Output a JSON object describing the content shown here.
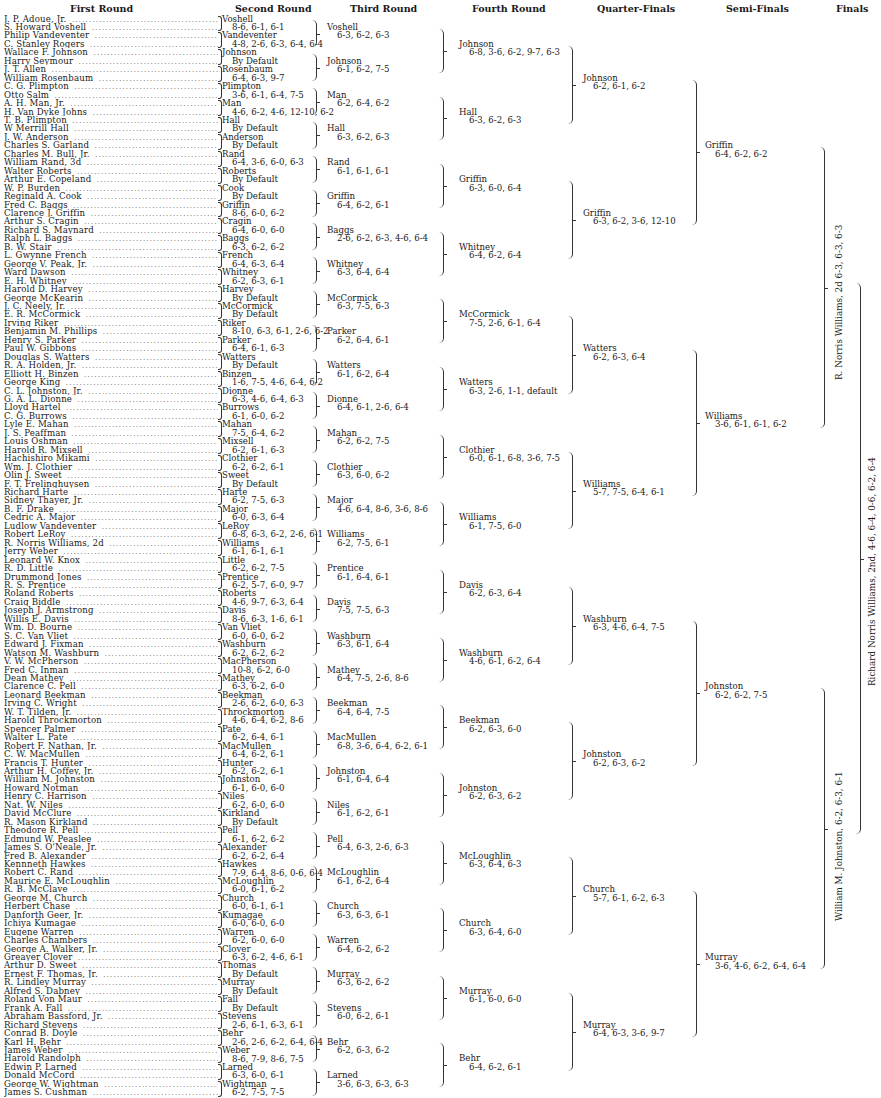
{
  "headers": {
    "first_round": "First Round",
    "second_round": "Second Round",
    "third_round": "Third Round",
    "fourth_round": "Fourth Round",
    "quarter_finals": "Quarter-Finals",
    "semi_finals": "Semi-Finals",
    "finals": "Finals"
  },
  "first_round": [
    "J. P. Adoue, Jr.",
    "S. Howard Voshell",
    "Philip Vandeventer",
    "C. Stanley Rogers",
    "Wallace F. Johnson",
    "Harry Seymour",
    "J. T. Allen",
    "William Rosenbaum",
    "C. G. Plimpton",
    "Otto Salm",
    "A. H. Man, Jr.",
    "H. Van Dyke Johns",
    "T. B. Plimpton",
    "W Merrill Hall",
    "J. W. Anderson",
    "Charles S. Garland",
    "Charles M. Bull, Jr.",
    "William Rand, 3d",
    "Walter Roberts",
    "Arthur E. Copeland",
    "W. P. Burden",
    "Reginald A. Cook",
    "Fred C. Baggs",
    "Clarence J. Griffin",
    "Arthur S. Cragin",
    "Richard S. Maynard",
    "Ralph L. Baggs",
    "B. W. Stair",
    "L. Gwynne French",
    "George V. Peak, Jr.",
    "Ward Dawson",
    "E. H. Whitney",
    "Harold D. Harvey",
    "George McKearin",
    "J. C. Neely, Jr.",
    "E. R. McCormick",
    "Irving Riker",
    "Benjamin M. Phillips",
    "Henry S. Parker",
    "Paul W. Gibbons",
    "Douglas S. Watters",
    "R. A. Holden, Jr.",
    "Elliott H. Binzen",
    "George King",
    "C. L. Johnston, Jr.",
    "G. A. L. Dionne",
    "Lloyd Hartel",
    "C. G. Burrows",
    "Lyle E. Mahan",
    "J. S. Peaffman",
    "Louis Oshman",
    "Harold R. Mixsell",
    "Hachishiro Mikami",
    "Wm. J. Clothier",
    "Olin J. Sweet",
    "F. T. Frelinghuysen",
    "Richard Harte",
    "Sidney Thayer, Jr.",
    "B. F. Drake",
    "Cedric A. Major",
    "Ludlow Vandeventer",
    "Robert LeRoy",
    "R. Norris Williams, 2d",
    "Jerry Weber",
    "Leonard W. Knox",
    "R. D. Little",
    "Drummond Jones",
    "R. S. Prentice",
    "Roland Roberts",
    "Craig Biddle",
    "Joseph J. Armstrong",
    "Willis E. Davis",
    "Wm. D. Bourne",
    "S. C. Van Vliet",
    "Edward J. Fixman",
    "Watson M. Washburn",
    "V. W. McPherson",
    "Fred C. Inman",
    "Dean Mathey",
    "Clarence C. Pell",
    "Leonard Beekman",
    "Irving C. Wright",
    "W. T. Tilden, Jr.",
    "Harold Throckmorton",
    "Spencer Palmer",
    "Walter L. Pate",
    "Robert F. Nathan, Jr.",
    "C. W. MacMullen",
    "Francis T. Hunter",
    "Arthur H. Coffey, Jr.",
    "William M. Johnston",
    "Howard Notman",
    "Henry C. Harrison",
    "Nat. W. Niles",
    "David McClure",
    "R. Mason Kirkland",
    "Theodore R. Pell",
    "Edmund W. Peaslee",
    "James S. O'Neale, Jr.",
    "Fred B. Alexander",
    "Kennneth Hawkes",
    "Robert C. Rand",
    "Maurice E. McLoughlin",
    "R. B. McClave",
    "George M. Church",
    "Herbert Chase",
    "Danforth Geer, Jr.",
    "Ichiya Kumagae",
    "Eugene Warren",
    "Charles Chambers",
    "George A. Walker, Jr.",
    "Greayer Clover",
    "Arthur D. Sweet",
    "Ernest F. Thomas, Jr.",
    "R. Lindley Murray",
    "Alfred S. Dabney",
    "Roland Von Maur",
    "Frank A. Fall",
    "Abraham Bassford, Jr.",
    "Richard Stevens",
    "Conrad B. Doyle",
    "Karl H. Behr",
    "James Weber",
    "Harold Randolph",
    "Edwin P. Larned",
    "Donald McCord",
    "George W. Wightman",
    "James S. Cushman"
  ],
  "second_round": [
    {
      "name": "Voshell",
      "score": "8-6, 6-1, 6-1"
    },
    {
      "name": "Vandeventer",
      "score": "4-8, 2-6, 6-3, 6-4, 6-4"
    },
    {
      "name": "Johnson",
      "score": "By Default"
    },
    {
      "name": "Rosenbaum",
      "score": "6-4, 6-3, 9-7"
    },
    {
      "name": "Plimpton",
      "score": "3-6, 6-1, 6-4, 7-5"
    },
    {
      "name": "Man",
      "score": "4-6, 6-2, 4-6, 12-10, 6-2"
    },
    {
      "name": "Hall",
      "score": "By Default"
    },
    {
      "name": "Anderson",
      "score": "By Default"
    },
    {
      "name": "Rand",
      "score": "6-4, 3-6, 6-0, 6-3"
    },
    {
      "name": "Roberts",
      "score": "By Default"
    },
    {
      "name": "Cook",
      "score": "By Default"
    },
    {
      "name": "Griffin",
      "score": "8-6, 6-0, 6-2"
    },
    {
      "name": "Cragin",
      "score": "6-4, 6-0, 6-0"
    },
    {
      "name": "Baggs",
      "score": "6-3, 6-2, 6-2"
    },
    {
      "name": "French",
      "score": "6-4, 6-3, 6-4"
    },
    {
      "name": "Whitney",
      "score": "6-2, 6-3, 6-1"
    },
    {
      "name": "Harvey",
      "score": "By Default"
    },
    {
      "name": "McCormick",
      "score": "By Default"
    },
    {
      "name": "Riker",
      "score": "8-10, 6-3, 6-1, 2-6, 6-2"
    },
    {
      "name": "Parker",
      "score": "6-4, 6-1, 6-3"
    },
    {
      "name": "Watters",
      "score": "By Default"
    },
    {
      "name": "Binzen",
      "score": "1-6, 7-5, 4-6, 6-4, 6-2"
    },
    {
      "name": "Dionne",
      "score": "6-3, 4-6, 6-4, 6-3"
    },
    {
      "name": "Burrows",
      "score": "6-1, 6-0, 6-2"
    },
    {
      "name": "Mahan",
      "score": "7-5, 6-4, 6-2"
    },
    {
      "name": "Mixsell",
      "score": "6-2, 6-1, 6-3"
    },
    {
      "name": "Clothier",
      "score": "6-2, 6-2, 6-1"
    },
    {
      "name": "Sweet",
      "score": "By Default"
    },
    {
      "name": "Harte",
      "score": "6-2, 7-5, 6-3"
    },
    {
      "name": "Major",
      "score": "6-0, 6-3, 6-4"
    },
    {
      "name": "LeRoy",
      "score": "6-8, 6-3, 6-2, 2-6, 6-1"
    },
    {
      "name": "Williams",
      "score": "6-1, 6-1, 6-1"
    },
    {
      "name": "Little",
      "score": "6-2, 6-2, 7-5"
    },
    {
      "name": "Prentice",
      "score": "6-2, 5-7, 6-0, 9-7"
    },
    {
      "name": "Roberts",
      "score": "4-6, 9-7, 6-3, 6-4"
    },
    {
      "name": "Davis",
      "score": "8-6, 6-3, 1-6, 6-1"
    },
    {
      "name": "Van Vliet",
      "score": "6-0, 6-0, 6-2"
    },
    {
      "name": "Washburn",
      "score": "6-2, 6-2, 6-2"
    },
    {
      "name": "MacPherson",
      "score": "10-8, 6-2, 6-0"
    },
    {
      "name": "Mathey",
      "score": "6-3, 6-2, 6-0"
    },
    {
      "name": "Beekman",
      "score": "2-6, 6-2, 6-0, 6-3"
    },
    {
      "name": "Throckmorton",
      "score": "4-6, 6-4, 6-2, 8-6"
    },
    {
      "name": "Pate",
      "score": "6-2, 6-4, 6-1"
    },
    {
      "name": "MacMullen",
      "score": "6-4, 6-2, 6-1"
    },
    {
      "name": "Hunter",
      "score": "6-2, 6-2, 6-1"
    },
    {
      "name": "Johnston",
      "score": "6-1, 6-0, 6-0"
    },
    {
      "name": "Niles",
      "score": "6-2, 6-0, 6-0"
    },
    {
      "name": "Kirkland",
      "score": "By Default"
    },
    {
      "name": "Pell",
      "score": "6-1, 6-2, 6-2"
    },
    {
      "name": "Alexander",
      "score": "6-2, 6-2, 6-4"
    },
    {
      "name": "Hawkes",
      "score": "7-9, 6-4, 8-6, 0-6, 6-4"
    },
    {
      "name": "McLoughlin",
      "score": "6-0, 6-1, 6-2"
    },
    {
      "name": "Church",
      "score": "6-0, 6-1, 6-1"
    },
    {
      "name": "Kumagae",
      "score": "6-0, 6-0, 6-0"
    },
    {
      "name": "Warren",
      "score": "6-2, 6-0, 6-0"
    },
    {
      "name": "Clover",
      "score": "6-3, 6-2, 4-6, 6-1"
    },
    {
      "name": "Thomas",
      "score": "By Default"
    },
    {
      "name": "Murray",
      "score": "By Default"
    },
    {
      "name": "Fall",
      "score": "By Default"
    },
    {
      "name": "Stevens",
      "score": "2-6, 6-1, 6-3, 6-1"
    },
    {
      "name": "Behr",
      "score": "2-6, 2-6, 6-2, 6-4, 6-4"
    },
    {
      "name": "Weber",
      "score": "8-6, 7-9, 8-6, 7-5"
    },
    {
      "name": "Larned",
      "score": "6-3, 6-0, 6-1"
    },
    {
      "name": "Wightman",
      "score": "6-2, 7-5, 7-5"
    }
  ],
  "third_round": [
    {
      "name": "Voshell",
      "score": "6-3, 6-2, 6-3"
    },
    {
      "name": "Johnson",
      "score": "6-1, 6-2, 7-5"
    },
    {
      "name": "Man",
      "score": "6-2, 6-4, 6-2"
    },
    {
      "name": "Hall",
      "score": "6-3, 6-2, 6-3"
    },
    {
      "name": "Rand",
      "score": "6-1, 6-1, 6-1"
    },
    {
      "name": "Griffin",
      "score": "6-4, 6-2, 6-1"
    },
    {
      "name": "Baggs",
      "score": "2-6, 6-2, 6-3, 4-6, 6-4"
    },
    {
      "name": "Whitney",
      "score": "6-3, 6-4, 6-4"
    },
    {
      "name": "McCormick",
      "score": "6-3, 7-5, 6-3"
    },
    {
      "name": "Parker",
      "score": "6-2, 6-4, 6-1"
    },
    {
      "name": "Watters",
      "score": "6-1, 6-2, 6-4"
    },
    {
      "name": "Dionne",
      "score": "6-4, 6-1, 2-6, 6-4"
    },
    {
      "name": "Mahan",
      "score": "6-2, 6-2, 7-5"
    },
    {
      "name": "Clothier",
      "score": "6-3, 6-0, 6-2"
    },
    {
      "name": "Major",
      "score": "4-6, 6-4, 8-6, 3-6, 8-6"
    },
    {
      "name": "Williams",
      "score": "6-2, 7-5, 6-1"
    },
    {
      "name": "Prentice",
      "score": "6-1, 6-4, 6-1"
    },
    {
      "name": "Davis",
      "score": "7-5, 7-5, 6-3"
    },
    {
      "name": "Washburn",
      "score": "6-3, 6-1, 6-4"
    },
    {
      "name": "Mathey",
      "score": "6-4, 7-5, 2-6, 8-6"
    },
    {
      "name": "Beekman",
      "score": "6-4, 6-4, 7-5"
    },
    {
      "name": "MacMullen",
      "score": "6-8, 3-6, 6-4, 6-2, 6-1"
    },
    {
      "name": "Johnston",
      "score": "6-1, 6-4, 6-4"
    },
    {
      "name": "Niles",
      "score": "6-1, 6-2, 6-1"
    },
    {
      "name": "Pell",
      "score": "6-4, 6-3, 2-6, 6-3"
    },
    {
      "name": "McLoughlin",
      "score": "6-1, 6-2, 6-4"
    },
    {
      "name": "Church",
      "score": "6-3, 6-3, 6-1"
    },
    {
      "name": "Warren",
      "score": "6-4, 6-2, 6-2"
    },
    {
      "name": "Murray",
      "score": "6-3, 6-2, 6-2"
    },
    {
      "name": "Stevens",
      "score": "6-0, 6-2, 6-1"
    },
    {
      "name": "Behr",
      "score": "6-2, 6-3, 6-2"
    },
    {
      "name": "Larned",
      "score": "3-6, 6-3, 6-3, 6-3"
    }
  ],
  "fourth_round": [
    {
      "name": "Johnson",
      "score": "6-8, 3-6, 6-2, 9-7, 6-3"
    },
    {
      "name": "Hall",
      "score": "6-3, 6-2, 6-3"
    },
    {
      "name": "Griffin",
      "score": "6-3, 6-0, 6-4"
    },
    {
      "name": "Whitney",
      "score": "6-4, 6-2, 6-4"
    },
    {
      "name": "McCormick",
      "score": "7-5, 2-6, 6-1, 6-4"
    },
    {
      "name": "Watters",
      "score": "6-3, 2-6, 1-1, default"
    },
    {
      "name": "Clothier",
      "score": "6-0, 6-1, 6-8, 3-6, 7-5"
    },
    {
      "name": "Williams",
      "score": "6-1, 7-5, 6-0"
    },
    {
      "name": "Davis",
      "score": "6-2, 6-3, 6-4"
    },
    {
      "name": "Washburn",
      "score": "4-6, 6-1, 6-2, 6-4"
    },
    {
      "name": "Beekman",
      "score": "6-2, 6-3, 6-0"
    },
    {
      "name": "Johnston",
      "score": "6-2, 6-3, 6-2"
    },
    {
      "name": "McLoughlin",
      "score": "6-3, 6-4, 6-3"
    },
    {
      "name": "Church",
      "score": "6-3, 6-4, 6-0"
    },
    {
      "name": "Murray",
      "score": "6-1, 6-0, 6-0"
    },
    {
      "name": "Behr",
      "score": "6-4, 6-2, 6-1"
    }
  ],
  "quarter_finals": [
    {
      "name": "Johnson",
      "score": "6-2, 6-1, 6-2"
    },
    {
      "name": "Griffin",
      "score": "6-3, 6-2, 3-6, 12-10"
    },
    {
      "name": "Watters",
      "score": "6-2, 6-3, 6-4"
    },
    {
      "name": "Williams",
      "score": "5-7, 7-5, 6-4, 6-1"
    },
    {
      "name": "Washburn",
      "score": "6-3, 4-6, 6-4, 7-5"
    },
    {
      "name": "Johnston",
      "score": "6-2, 6-3, 6-2"
    },
    {
      "name": "Church",
      "score": "5-7, 6-1, 6-2, 6-3"
    },
    {
      "name": "Murray",
      "score": "6-4, 6-3, 3-6, 9-7"
    }
  ],
  "semi_finals": [
    {
      "name": "Griffin",
      "score": "6-4, 6-2, 6-2"
    },
    {
      "name": "Williams",
      "score": "3-6, 6-1, 6-1, 6-2"
    },
    {
      "name": "Johnston",
      "score": "6-2, 6-2, 7-5"
    },
    {
      "name": "Murray",
      "score": "3-6, 4-6, 6-2, 6-4, 6-4"
    }
  ],
  "finals": [
    {
      "text": "R. Norris Williams, 2d 6-3, 6-3, 6-3"
    },
    {
      "text": "William M. Johnston, 6-2, 6-3, 6-1"
    }
  ],
  "champion": {
    "text": "Richard Norris Williams, 2nd, 4-6, 6-4, 0-6, 6-2, 6-4"
  }
}
